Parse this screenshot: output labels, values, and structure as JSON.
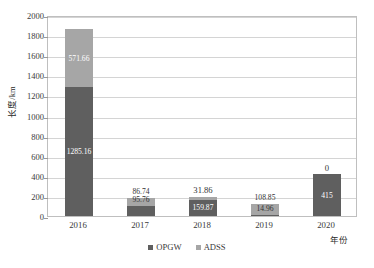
{
  "chart_data": {
    "type": "bar",
    "subtype": "stacked-column",
    "title": "",
    "xlabel": "年份",
    "ylabel": "长度/km",
    "categories": [
      "2016",
      "2017",
      "2018",
      "2019",
      "2020"
    ],
    "series": [
      {
        "name": "OPGW",
        "color": "#5f5f5f",
        "values": [
          1285.16,
          95.76,
          159.87,
          14.96,
          415
        ],
        "labels": [
          "1285.16",
          "95.76",
          "159.87",
          "14.96",
          "415"
        ]
      },
      {
        "name": "ADSS",
        "color": "#a6a6a6",
        "values": [
          571.66,
          86.74,
          31.86,
          108.85,
          0
        ],
        "labels": [
          "571.66",
          "86.74",
          "31.86",
          "108.85",
          "0"
        ]
      }
    ],
    "ylim": [
      0,
      2000
    ],
    "yticks": [
      0,
      200,
      400,
      600,
      800,
      1000,
      1200,
      1400,
      1600,
      1800,
      2000
    ],
    "ytick_labels": [
      "0",
      "200",
      "400",
      "600",
      "800",
      "1000",
      "1200",
      "1400",
      "1600",
      "1800",
      "2000"
    ],
    "grid": true,
    "legend_position": "bottom"
  },
  "legend": {
    "items": [
      {
        "label": "OPGW",
        "color": "#5f5f5f"
      },
      {
        "label": "ADSS",
        "color": "#a6a6a6"
      }
    ]
  }
}
